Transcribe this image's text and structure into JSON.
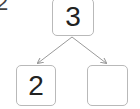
{
  "diagram": {
    "type": "number-bond",
    "corner_label": "2",
    "whole": "3",
    "parts": [
      "2",
      ""
    ],
    "colors": {
      "border": "#b9b9b9",
      "arrow": "#9a9a9a",
      "text": "#222222"
    }
  }
}
